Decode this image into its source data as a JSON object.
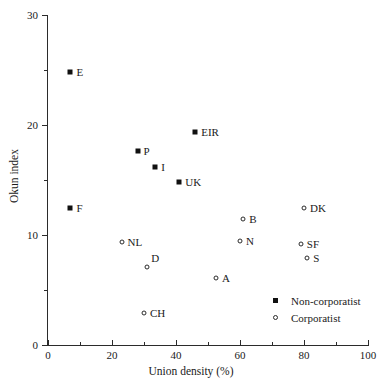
{
  "chart_data": {
    "type": "scatter",
    "title": "",
    "xlabel": "Union density (%)",
    "ylabel": "Okun index",
    "xlim": [
      0,
      100
    ],
    "ylim": [
      0,
      30
    ],
    "xticks": [
      0,
      20,
      40,
      60,
      80,
      100
    ],
    "yticks": [
      0,
      10,
      20,
      30
    ],
    "x_minor_ticks": [
      10,
      30,
      50,
      70,
      90
    ],
    "y_minor_ticks": [
      5,
      15,
      25
    ],
    "grid": false,
    "legend_position": "lower-right",
    "series": [
      {
        "name": "Non-corporatist",
        "marker": "filled-square",
        "color": "#111111",
        "points": [
          {
            "label": "E",
            "x": 7.0,
            "y": 24.8,
            "label_dx": 6,
            "label_dy": 0
          },
          {
            "label": "F",
            "x": 7.0,
            "y": 12.5,
            "label_dx": 6,
            "label_dy": 0
          },
          {
            "label": "P",
            "x": 28.0,
            "y": 17.6,
            "label_dx": 6,
            "label_dy": 0
          },
          {
            "label": "I",
            "x": 33.5,
            "y": 16.2,
            "label_dx": 6,
            "label_dy": 0
          },
          {
            "label": "EIR",
            "x": 46.0,
            "y": 19.4,
            "label_dx": 6,
            "label_dy": 0
          },
          {
            "label": "UK",
            "x": 41.0,
            "y": 14.8,
            "label_dx": 6,
            "label_dy": 0
          }
        ]
      },
      {
        "name": "Corporatist",
        "marker": "open-circle",
        "color": "#2b2b2b",
        "points": [
          {
            "label": "NL",
            "x": 23.0,
            "y": 9.4,
            "label_dx": 6,
            "label_dy": 0
          },
          {
            "label": "D",
            "x": 31.0,
            "y": 7.1,
            "label_dx": 4,
            "label_dy": -9
          },
          {
            "label": "CH",
            "x": 30.0,
            "y": 2.9,
            "label_dx": 6,
            "label_dy": 0
          },
          {
            "label": "A",
            "x": 52.5,
            "y": 6.1,
            "label_dx": 6,
            "label_dy": 0
          },
          {
            "label": "B",
            "x": 61.0,
            "y": 11.5,
            "label_dx": 6,
            "label_dy": 0
          },
          {
            "label": "N",
            "x": 60.0,
            "y": 9.5,
            "label_dx": 6,
            "label_dy": 0
          },
          {
            "label": "DK",
            "x": 80.0,
            "y": 12.5,
            "label_dx": 6,
            "label_dy": 0
          },
          {
            "label": "SF",
            "x": 79.0,
            "y": 9.2,
            "label_dx": 6,
            "label_dy": 0
          },
          {
            "label": "S",
            "x": 81.0,
            "y": 7.9,
            "label_dx": 6,
            "label_dy": 0
          }
        ]
      }
    ]
  },
  "axes": {
    "x_label": "Union density (%)",
    "y_label": "Okun index",
    "x_tick_labels": [
      "0",
      "20",
      "40",
      "60",
      "80",
      "100"
    ],
    "y_tick_labels": [
      "0",
      "10",
      "20",
      "30"
    ]
  },
  "legend": {
    "items": [
      {
        "label": "Non-corporatist",
        "marker": "filled-square"
      },
      {
        "label": "Corporatist",
        "marker": "open-circle"
      }
    ]
  },
  "colors": {
    "axis": "#2b2b2b",
    "text": "#1a1a1a",
    "background": "#ffffff",
    "marker_filled": "#111111",
    "marker_open_stroke": "#2b2b2b"
  }
}
